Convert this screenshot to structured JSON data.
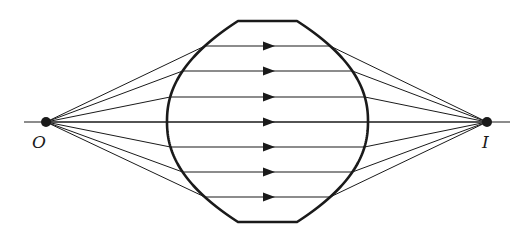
{
  "diagram": {
    "title": "",
    "colors": {
      "stroke": "#1a1a1a",
      "background": "#ffffff"
    },
    "object_point": {
      "label": "O",
      "x": 46,
      "y": 122
    },
    "image_point": {
      "label": "I",
      "x": 487,
      "y": 122
    },
    "axis": {
      "x1": 24,
      "x2": 510,
      "y": 122
    },
    "lens": {
      "type": "thick lens with curved sides and flat top/bottom",
      "top_flat": {
        "x1": 238,
        "x2": 297,
        "y": 21
      },
      "bottom_flat": {
        "x1": 238,
        "x2": 297,
        "y": 222
      },
      "left_extreme_x": 167,
      "right_extreme_x": 368
    },
    "rays": {
      "count": 7,
      "y_values_inside_lens": [
        46,
        71,
        97,
        122,
        147,
        172,
        197
      ],
      "arrow_x": 268,
      "direction": "left-to-right"
    }
  }
}
